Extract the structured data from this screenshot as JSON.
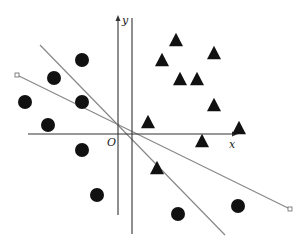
{
  "figure": {
    "width": 306,
    "height": 248,
    "colors": {
      "points": "#111111",
      "axes": "#333333",
      "lines": "#888888",
      "background": "#ffffff"
    },
    "axes": {
      "x_label": "x",
      "y_label": "y",
      "origin_label": "O",
      "x_axis": {
        "x1": 28,
        "x2": 238,
        "y": 134
      },
      "y_axis": {
        "x": 118,
        "y1": 15,
        "y2": 215
      },
      "x_label_pos": {
        "x": 229,
        "y": 148
      },
      "y_label_pos": {
        "x": 122,
        "y": 24
      },
      "origin_label_pos": {
        "x": 107,
        "y": 146
      }
    },
    "vertical_line": {
      "x": 132,
      "y1": 18,
      "y2": 234
    },
    "separating_lines": [
      {
        "x1": 17,
        "y1": 75,
        "x2": 290,
        "y2": 209,
        "endpoint_markers": true
      },
      {
        "x1": 40,
        "y1": 45,
        "x2": 225,
        "y2": 235,
        "endpoint_markers": false
      }
    ],
    "circles": [
      {
        "x": 82,
        "y": 60
      },
      {
        "x": 54,
        "y": 78
      },
      {
        "x": 25,
        "y": 102
      },
      {
        "x": 82,
        "y": 102
      },
      {
        "x": 48,
        "y": 125
      },
      {
        "x": 82,
        "y": 150
      },
      {
        "x": 97,
        "y": 195
      },
      {
        "x": 178,
        "y": 214
      },
      {
        "x": 238,
        "y": 206
      }
    ],
    "triangles": [
      {
        "x": 176,
        "y": 40
      },
      {
        "x": 162,
        "y": 60
      },
      {
        "x": 214,
        "y": 53
      },
      {
        "x": 180,
        "y": 79
      },
      {
        "x": 197,
        "y": 79
      },
      {
        "x": 214,
        "y": 105
      },
      {
        "x": 148,
        "y": 122
      },
      {
        "x": 239,
        "y": 128
      },
      {
        "x": 202,
        "y": 141
      },
      {
        "x": 157,
        "y": 168
      }
    ],
    "circle_radius": 7,
    "triangle_size": 14
  }
}
